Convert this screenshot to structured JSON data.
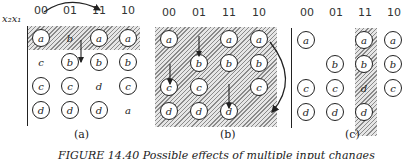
{
  "var_label": "x₂x₁",
  "columns": [
    "00",
    "01",
    "11",
    "10"
  ],
  "panels": [
    {
      "id": "a",
      "label": "(a)",
      "cells": [
        [
          {
            "v": "a",
            "c": true
          },
          {
            "v": "b",
            "c": false
          },
          {
            "v": "a",
            "c": true
          },
          {
            "v": "a",
            "c": true
          }
        ],
        [
          {
            "v": "c",
            "c": false
          },
          {
            "v": "b",
            "c": true
          },
          {
            "v": "b",
            "c": true
          },
          {
            "v": "b",
            "c": true
          }
        ],
        [
          {
            "v": "c",
            "c": true
          },
          {
            "v": "c",
            "c": true
          },
          {
            "v": "d",
            "c": false
          },
          {
            "v": "c",
            "c": true
          }
        ],
        [
          {
            "v": "d",
            "c": true
          },
          {
            "v": "d",
            "c": true
          },
          {
            "v": "d",
            "c": true
          },
          {
            "v": "a",
            "c": false
          }
        ]
      ]
    },
    {
      "id": "b",
      "label": "(b)",
      "cells": [
        [
          {
            "v": "a",
            "c": true
          },
          {
            "v": "",
            "c": false
          },
          {
            "v": "a",
            "c": true
          },
          {
            "v": "a",
            "c": true
          }
        ],
        [
          {
            "v": "",
            "c": false
          },
          {
            "v": "b",
            "c": true
          },
          {
            "v": "b",
            "c": true
          },
          {
            "v": "b",
            "c": true
          }
        ],
        [
          {
            "v": "c",
            "c": true
          },
          {
            "v": "c",
            "c": true
          },
          {
            "v": "",
            "c": false
          },
          {
            "v": "c",
            "c": true
          }
        ],
        [
          {
            "v": "d",
            "c": true
          },
          {
            "v": "d",
            "c": true
          },
          {
            "v": "d",
            "c": true
          },
          {
            "v": "",
            "c": false
          }
        ]
      ]
    },
    {
      "id": "c",
      "label": "(c)",
      "cells": [
        [
          {
            "v": "a",
            "c": true
          },
          {
            "v": "",
            "c": false
          },
          {
            "v": "a",
            "c": true
          },
          {
            "v": "a",
            "c": true
          }
        ],
        [
          {
            "v": "",
            "c": false
          },
          {
            "v": "b",
            "c": true
          },
          {
            "v": "b",
            "c": true
          },
          {
            "v": "b",
            "c": true
          }
        ],
        [
          {
            "v": "c",
            "c": true
          },
          {
            "v": "c",
            "c": true
          },
          {
            "v": "d",
            "c": false
          },
          {
            "v": "c",
            "c": true
          }
        ],
        [
          {
            "v": "d",
            "c": true
          },
          {
            "v": "d",
            "c": true
          },
          {
            "v": "d",
            "c": true
          },
          {
            "v": "",
            "c": false
          }
        ]
      ]
    }
  ],
  "caption": "FIGURE 14.40   Possible effects of multiple input changes"
}
